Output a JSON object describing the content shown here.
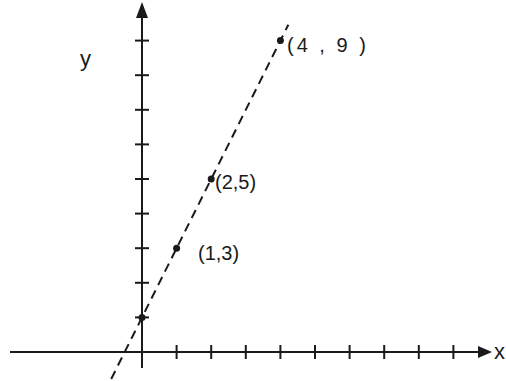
{
  "chart_data": {
    "type": "scatter",
    "title": "",
    "xlabel": "x",
    "ylabel": "y",
    "points": [
      {
        "x": 1,
        "y": 3,
        "label": "(1,3)"
      },
      {
        "x": 2,
        "y": 5,
        "label": "(2,5)"
      },
      {
        "x": 4,
        "y": 9,
        "label": "(4 , 9 )"
      }
    ],
    "line": {
      "style": "dashed",
      "slope": 2,
      "intercept": 1,
      "equation": "y = 2x + 1"
    },
    "intercept_point": {
      "x": 0,
      "y": 1
    },
    "x_ticks": [
      1,
      2,
      3,
      4,
      5,
      6,
      7,
      8,
      9
    ],
    "y_ticks": [
      1,
      2,
      3,
      4,
      5,
      6,
      7,
      8,
      9
    ],
    "xlim": [
      -4,
      10
    ],
    "ylim": [
      -0.5,
      10
    ],
    "grid": false,
    "legend": null,
    "colors": {
      "ink": "#1a1a1a",
      "background": "#ffffff"
    }
  },
  "labels": {
    "x_axis": "x",
    "y_axis": "y",
    "p0": "(1,3)",
    "p1": "(2,5)",
    "p2": "(4 , 9 )"
  }
}
